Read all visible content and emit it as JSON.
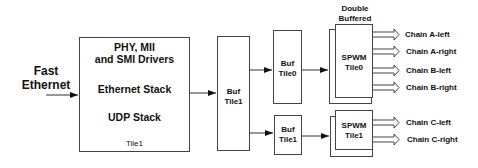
{
  "input": {
    "label_line1": "Fast",
    "label_line2": "Ethernet"
  },
  "main_block": {
    "line1": "PHY, MII",
    "line2": "and SMI Drivers",
    "line3": "Ethernet Stack",
    "line4": "UDP Stack",
    "tile": "Tile1"
  },
  "buffers": [
    {
      "line1": "Buf",
      "line2": "Tile1"
    },
    {
      "line1": "Buf",
      "line2": "Tile0"
    },
    {
      "line1": "Buf",
      "line2": "Tile1"
    }
  ],
  "double_buffered": {
    "line1": "Double",
    "line2": "Buffered"
  },
  "spwm": [
    {
      "line1": "SPWM",
      "line2": "Tile0"
    },
    {
      "line1": "SPWM",
      "line2": "Tile1"
    }
  ],
  "outputs": [
    "Chain A-left",
    "Chain A-right",
    "Chain B-left",
    "Chain B-right",
    "Chain C-left",
    "Chain C-right"
  ]
}
